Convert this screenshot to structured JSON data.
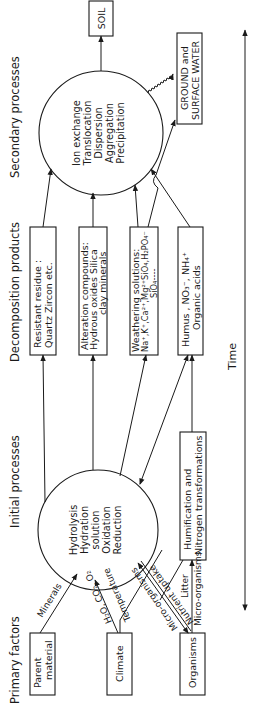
{
  "headers": {
    "primary": "Primary factors",
    "initial": "Initial processes",
    "decomposition": "Decomposition products",
    "secondary": "Secondary processes"
  },
  "primary_factors": [
    {
      "line1": "Parent",
      "line2": "material"
    },
    {
      "line1": "Climate",
      "line2": ""
    },
    {
      "line1": "Organisms",
      "line2": ""
    }
  ],
  "initial_processes": [
    "Hydrolysis",
    "Hydration",
    "solution",
    "Oxidation",
    "Reduction"
  ],
  "humification_box": {
    "line1": "Humification and",
    "line2": "Nitrogen transformations"
  },
  "decomposition_products": [
    {
      "line1": "Resistant  residue :",
      "line2": "Quartz   Zircon etc.",
      "line3": ""
    },
    {
      "line1": "Alteration compounds:",
      "line2": "Hydrous oxides  Silica",
      "line3": "clay minerals"
    },
    {
      "line1": "Weathering solutions:",
      "line2": "Na⁺,K⁺,Ca²⁺,Mg²⁺SiO₄,H₂PO₄⁻",
      "line3": "SiO₄----"
    },
    {
      "line1": "Humus , NO₃⁻, NH₄⁺",
      "line2": "Organic acids",
      "line3": ""
    }
  ],
  "secondary_processes": [
    "Ion exchange",
    "Translocation",
    "Dispersion",
    "Aggregation",
    "Precipitation"
  ],
  "outputs": {
    "soil": "SOIL",
    "water_line1": "GROUND and",
    "water_line2": "SURFACE WATER"
  },
  "arrow_labels": {
    "minerals": "Minerals",
    "climate_a": "H₂O, CO₂, O₂",
    "climate_b": "Temperature",
    "org_a": "Micro-organisms",
    "org_b": "Nutrient uptake",
    "org_c": "Litter",
    "org_d": "Micro-organisms"
  },
  "time_axis": {
    "label": "Time"
  }
}
